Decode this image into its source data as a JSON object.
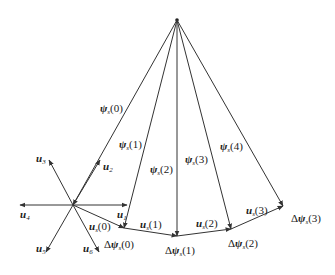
{
  "diagram": {
    "title": "",
    "colors": {
      "stroke": "#333333",
      "text": "#1a1a1a",
      "background": "#ffffff"
    },
    "apex": {
      "x": 177,
      "y": 20
    },
    "star_center": {
      "x": 73,
      "y": 205
    },
    "flux_vectors": [
      {
        "id": "psi0",
        "label_main": "ψ",
        "label_sub": "s",
        "label_arg": "(0)",
        "end": {
          "x": 73,
          "y": 205
        },
        "label_pos": {
          "x": 100,
          "y": 112
        }
      },
      {
        "id": "psi1",
        "label_main": "ψ",
        "label_sub": "s",
        "label_arg": "(1)",
        "end": {
          "x": 124,
          "y": 228
        },
        "label_pos": {
          "x": 119,
          "y": 148
        }
      },
      {
        "id": "psi2",
        "label_main": "ψ",
        "label_sub": "s",
        "label_arg": "(2)",
        "end": {
          "x": 177,
          "y": 236
        },
        "label_pos": {
          "x": 150,
          "y": 173
        }
      },
      {
        "id": "psi3",
        "label_main": "ψ",
        "label_sub": "s",
        "label_arg": "(3)",
        "end": {
          "x": 231,
          "y": 229
        },
        "label_pos": {
          "x": 185,
          "y": 163
        }
      },
      {
        "id": "psi4",
        "label_main": "ψ",
        "label_sub": "s",
        "label_arg": "(4)",
        "end": {
          "x": 283,
          "y": 206
        },
        "label_pos": {
          "x": 220,
          "y": 150
        }
      }
    ],
    "delta_labels": [
      {
        "text": "Δψ",
        "sub": "s",
        "arg": "(0)",
        "x": 104,
        "y": 248
      },
      {
        "text": "Δψ",
        "sub": "s",
        "arg": "(1)",
        "x": 165,
        "y": 254
      },
      {
        "text": "Δψ",
        "sub": "s",
        "arg": "(2)",
        "x": 228,
        "y": 247
      },
      {
        "text": "Δψ",
        "sub": "s",
        "arg": "(3)",
        "x": 291,
        "y": 222
      }
    ],
    "trajectory_segments": [
      {
        "label": "u",
        "sub": "s",
        "arg": "(0)",
        "x": 89,
        "y": 230
      },
      {
        "label": "u",
        "sub": "s",
        "arg": "(1)",
        "x": 140,
        "y": 228
      },
      {
        "label": "u",
        "sub": "s",
        "arg": "(2)",
        "x": 196,
        "y": 227
      },
      {
        "label": "u",
        "sub": "s",
        "arg": "(3)",
        "x": 246,
        "y": 214
      }
    ],
    "voltage_vectors": [
      {
        "id": "u1",
        "label": "u",
        "sub": "1",
        "tip": {
          "x": 127,
          "y": 205
        },
        "label_pos": {
          "x": 117,
          "y": 218
        }
      },
      {
        "id": "u2",
        "label": "u",
        "sub": "2",
        "tip": {
          "x": 100,
          "y": 160
        },
        "label_pos": {
          "x": 103,
          "y": 170
        }
      },
      {
        "id": "u3",
        "label": "u",
        "sub": "3",
        "tip": {
          "x": 49,
          "y": 160
        },
        "label_pos": {
          "x": 36,
          "y": 162
        }
      },
      {
        "id": "u4",
        "label": "u",
        "sub": "4",
        "tip": {
          "x": 20,
          "y": 205
        },
        "label_pos": {
          "x": 20,
          "y": 218
        }
      },
      {
        "id": "u5",
        "label": "u",
        "sub": "5",
        "tip": {
          "x": 46,
          "y": 252
        },
        "label_pos": {
          "x": 36,
          "y": 252
        }
      },
      {
        "id": "u6",
        "label": "u",
        "sub": "6",
        "tip": {
          "x": 99,
          "y": 252
        },
        "label_pos": {
          "x": 83,
          "y": 252
        }
      }
    ]
  }
}
